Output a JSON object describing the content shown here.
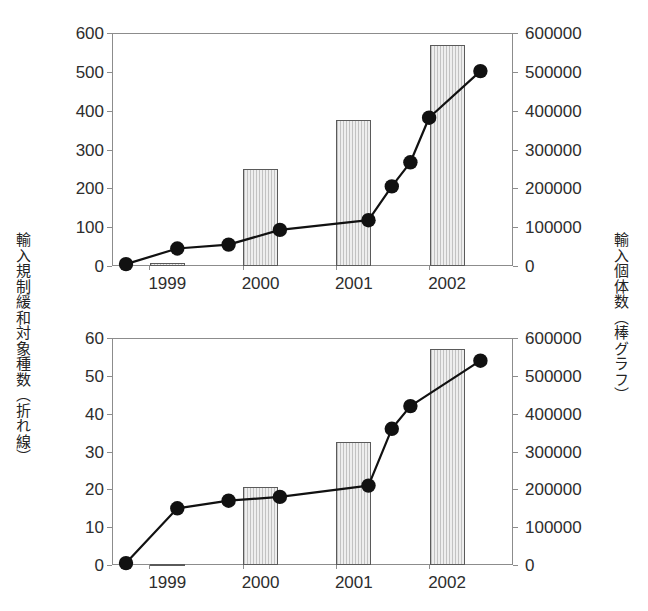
{
  "figure": {
    "left_axis_title": "輸入規制緩和対象種数（折れ線）",
    "right_axis_title": "輸入個体数（棒グラフ）"
  },
  "chart_data": [
    {
      "id": "top",
      "type": "bar",
      "title": "",
      "xlabel": "",
      "ylabel": "輸入規制緩和対象種数（折れ線）",
      "y2label": "輸入個体数（棒グラフ）",
      "grid": false,
      "legend": "none",
      "xlim": [
        1998.6,
        2002.9
      ],
      "ylim": [
        0,
        600
      ],
      "y2lim": [
        0,
        600000
      ],
      "yticks": [
        0,
        100,
        200,
        300,
        400,
        500,
        600
      ],
      "ytick_labels": [
        "0",
        "100",
        "200",
        "300",
        "400",
        "500",
        "600"
      ],
      "y2ticks": [
        0,
        100000,
        200000,
        300000,
        400000,
        500000,
        600000
      ],
      "y2tick_labels": [
        "0",
        "100000",
        "200000",
        "300000",
        "400000",
        "500000",
        "600000"
      ],
      "categories": [
        "1999",
        "2000",
        "2001",
        "2002"
      ],
      "xtick_labels": [
        "1999",
        "2000",
        "2001",
        "2002"
      ],
      "bars": {
        "name": "輸入個体数",
        "axis": "y2",
        "x": [
          1999,
          2000,
          2001,
          2002
        ],
        "values": [
          8000,
          250000,
          375000,
          570000
        ]
      },
      "series": [
        {
          "name": "輸入規制緩和対象種数",
          "axis": "y1",
          "type": "line",
          "marker": "circle",
          "x": [
            1998.75,
            1999.3,
            1999.85,
            2000.4,
            2001.35,
            2001.6,
            2001.8,
            2002.0,
            2002.55
          ],
          "values": [
            5,
            45,
            55,
            93,
            118,
            205,
            267,
            382,
            502
          ]
        }
      ]
    },
    {
      "id": "bottom",
      "type": "bar",
      "title": "",
      "xlabel": "",
      "ylabel": "輸入規制緩和対象種数（折れ線）",
      "y2label": "輸入個体数（棒グラフ）",
      "grid": false,
      "legend": "none",
      "xlim": [
        1998.6,
        2002.9
      ],
      "ylim": [
        0,
        60
      ],
      "y2lim": [
        0,
        600000
      ],
      "yticks": [
        0,
        10,
        20,
        30,
        40,
        50,
        60
      ],
      "ytick_labels": [
        "0",
        "10",
        "20",
        "30",
        "40",
        "50",
        "60"
      ],
      "y2ticks": [
        0,
        100000,
        200000,
        300000,
        400000,
        500000,
        600000
      ],
      "y2tick_labels": [
        "0",
        "100000",
        "200000",
        "300000",
        "400000",
        "500000",
        "600000"
      ],
      "categories": [
        "1999",
        "2000",
        "2001",
        "2002"
      ],
      "xtick_labels": [
        "1999",
        "2000",
        "2001",
        "2002"
      ],
      "bars": {
        "name": "輸入個体数",
        "axis": "y2",
        "x": [
          1999,
          2000,
          2001,
          2002
        ],
        "values": [
          2000,
          205000,
          325000,
          570000
        ]
      },
      "series": [
        {
          "name": "輸入規制緩和対象種数",
          "axis": "y1",
          "type": "line",
          "marker": "circle",
          "x": [
            1998.75,
            1999.3,
            1999.85,
            2000.4,
            2001.35,
            2001.6,
            2001.8,
            2002.55
          ],
          "values": [
            0.5,
            15,
            17,
            18,
            21,
            36,
            42,
            54
          ]
        }
      ]
    }
  ],
  "style": {
    "line_color": "#111111",
    "marker_color": "#111111",
    "bar_fill": "#dcdcdc",
    "bar_edge": "#5a5a5a",
    "axis_color": "#8c8c8c",
    "text_color": "#2d2d2d"
  }
}
